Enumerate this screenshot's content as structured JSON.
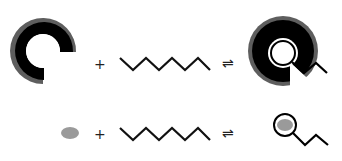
{
  "diagram": {
    "row1": {
      "reactant_a": {
        "type": "c-shaped-host-ring",
        "outer_color": "#5e5e5e",
        "inner_color": "#000000"
      },
      "operator_plus": "+",
      "reactant_b": {
        "type": "zigzag-chain",
        "color": "#111111"
      },
      "operator_equilibrium": "⇌",
      "product": {
        "type": "host-ring-with-bound-guest",
        "ring_color": "#000000",
        "guest_loop_color": "#ffffff"
      }
    },
    "row2": {
      "reactant_a": {
        "type": "gray-ellipse",
        "color": "#9a9a9a"
      },
      "operator_plus": "+",
      "reactant_b": {
        "type": "zigzag-chain",
        "color": "#111111"
      },
      "operator_equilibrium": "⇌",
      "product": {
        "type": "ellipse-in-loop-with-chain",
        "ellipse_color": "#9a9a9a"
      }
    }
  }
}
